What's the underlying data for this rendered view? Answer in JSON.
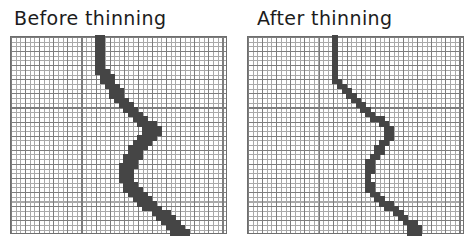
{
  "figure": {
    "background": "#ffffff"
  },
  "colors": {
    "title_text": "#1c1c1c",
    "grid_line": "#a9a9a9",
    "grid_line_accent": "#7d7d7d",
    "grid_border": "#6e6e6e",
    "fill": "#454545"
  },
  "panels": [
    {
      "title": "Before thinning",
      "grid": {
        "cols": 46,
        "rows": 42,
        "cell_px": 4.7
      },
      "filled_rows": [
        [
          0,
          18,
          19
        ],
        [
          1,
          18,
          19
        ],
        [
          2,
          18,
          19
        ],
        [
          3,
          18,
          19
        ],
        [
          4,
          18,
          19
        ],
        [
          5,
          18,
          19
        ],
        [
          6,
          18,
          19
        ],
        [
          7,
          18,
          20
        ],
        [
          8,
          19,
          21
        ],
        [
          9,
          19,
          21
        ],
        [
          10,
          20,
          22
        ],
        [
          11,
          21,
          23
        ],
        [
          12,
          21,
          23
        ],
        [
          13,
          22,
          24
        ],
        [
          14,
          23,
          25
        ],
        [
          15,
          24,
          26
        ],
        [
          16,
          25,
          27
        ],
        [
          17,
          26,
          28
        ],
        [
          18,
          27,
          30
        ],
        [
          19,
          28,
          31
        ],
        [
          20,
          28,
          31
        ],
        [
          21,
          27,
          30
        ],
        [
          22,
          26,
          29
        ],
        [
          23,
          25,
          28
        ],
        [
          24,
          25,
          27
        ],
        [
          25,
          24,
          27
        ],
        [
          26,
          24,
          26
        ],
        [
          27,
          23,
          26
        ],
        [
          28,
          23,
          25
        ],
        [
          29,
          23,
          25
        ],
        [
          30,
          23,
          25
        ],
        [
          31,
          24,
          26
        ],
        [
          32,
          24,
          27
        ],
        [
          33,
          25,
          28
        ],
        [
          34,
          26,
          29
        ],
        [
          35,
          27,
          30
        ],
        [
          36,
          28,
          31
        ],
        [
          37,
          30,
          33
        ],
        [
          38,
          31,
          34
        ],
        [
          39,
          32,
          35
        ],
        [
          40,
          33,
          36
        ],
        [
          41,
          34,
          37
        ]
      ]
    },
    {
      "title": "After thinning",
      "grid": {
        "cols": 46,
        "rows": 42,
        "cell_px": 4.7
      },
      "filled_rows": [
        [
          0,
          18,
          18
        ],
        [
          1,
          18,
          18
        ],
        [
          2,
          18,
          18
        ],
        [
          3,
          18,
          18
        ],
        [
          4,
          18,
          18
        ],
        [
          5,
          18,
          18
        ],
        [
          6,
          18,
          18
        ],
        [
          7,
          18,
          18
        ],
        [
          8,
          18,
          18
        ],
        [
          9,
          18,
          19
        ],
        [
          10,
          19,
          20
        ],
        [
          11,
          20,
          21
        ],
        [
          12,
          21,
          22
        ],
        [
          13,
          22,
          23
        ],
        [
          14,
          23,
          24
        ],
        [
          15,
          24,
          25
        ],
        [
          16,
          25,
          26
        ],
        [
          17,
          26,
          28
        ],
        [
          18,
          28,
          29
        ],
        [
          19,
          29,
          30
        ],
        [
          20,
          29,
          30
        ],
        [
          21,
          29,
          30
        ],
        [
          22,
          28,
          29
        ],
        [
          23,
          27,
          28
        ],
        [
          24,
          27,
          28
        ],
        [
          25,
          26,
          27
        ],
        [
          26,
          25,
          26
        ],
        [
          27,
          25,
          26
        ],
        [
          28,
          25,
          26
        ],
        [
          29,
          25,
          25
        ],
        [
          30,
          25,
          25
        ],
        [
          31,
          25,
          26
        ],
        [
          32,
          25,
          26
        ],
        [
          33,
          26,
          27
        ],
        [
          34,
          27,
          28
        ],
        [
          35,
          28,
          30
        ],
        [
          36,
          29,
          31
        ],
        [
          37,
          31,
          32
        ],
        [
          38,
          32,
          33
        ],
        [
          39,
          33,
          35
        ],
        [
          40,
          34,
          36
        ],
        [
          41,
          34,
          36
        ]
      ]
    }
  ]
}
